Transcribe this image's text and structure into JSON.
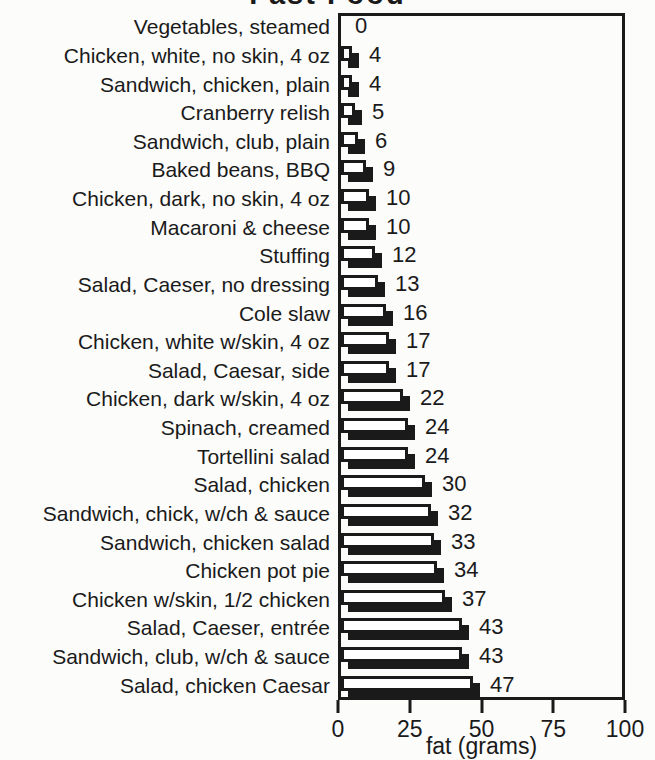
{
  "chart_data": {
    "type": "bar",
    "orientation": "horizontal",
    "title_visible": "Fast Food",
    "title_note": "title clipped at top edge of scan",
    "xlabel": "fat (grams)",
    "xlim": [
      0,
      100
    ],
    "xticks": [
      0,
      25,
      50,
      75,
      100
    ],
    "xtick_labels": [
      "0",
      "25",
      "50",
      "75",
      "100"
    ],
    "grid": false,
    "legend": false,
    "bar_fill": "#ffffff",
    "bar_border": "#1a1a1a",
    "bar_shadow": "#1a1a1a",
    "background": "#fcfcfb",
    "categories": [
      "Vegetables, steamed",
      "Chicken, white, no skin, 4 oz",
      "Sandwich, chicken, plain",
      "Cranberry relish",
      "Sandwich, club, plain",
      "Baked beans, BBQ",
      "Chicken, dark, no skin, 4 oz",
      "Macaroni & cheese",
      "Stuffing",
      "Salad, Caeser, no dressing",
      "Cole slaw",
      "Chicken, white w/skin, 4 oz",
      "Salad, Caesar, side",
      "Chicken, dark w/skin, 4 oz",
      "Spinach, creamed",
      "Tortellini salad",
      "Salad, chicken",
      "Sandwich, chick, w/ch & sauce",
      "Sandwich, chicken salad",
      "Chicken pot pie",
      "Chicken w/skin, 1/2 chicken",
      "Salad, Caeser, entrée",
      "Sandwich, club, w/ch & sauce",
      "Salad, chicken Caesar"
    ],
    "values": [
      0,
      4,
      4,
      5,
      6,
      9,
      10,
      10,
      12,
      13,
      16,
      17,
      17,
      22,
      24,
      24,
      30,
      32,
      33,
      34,
      37,
      43,
      43,
      47
    ]
  }
}
